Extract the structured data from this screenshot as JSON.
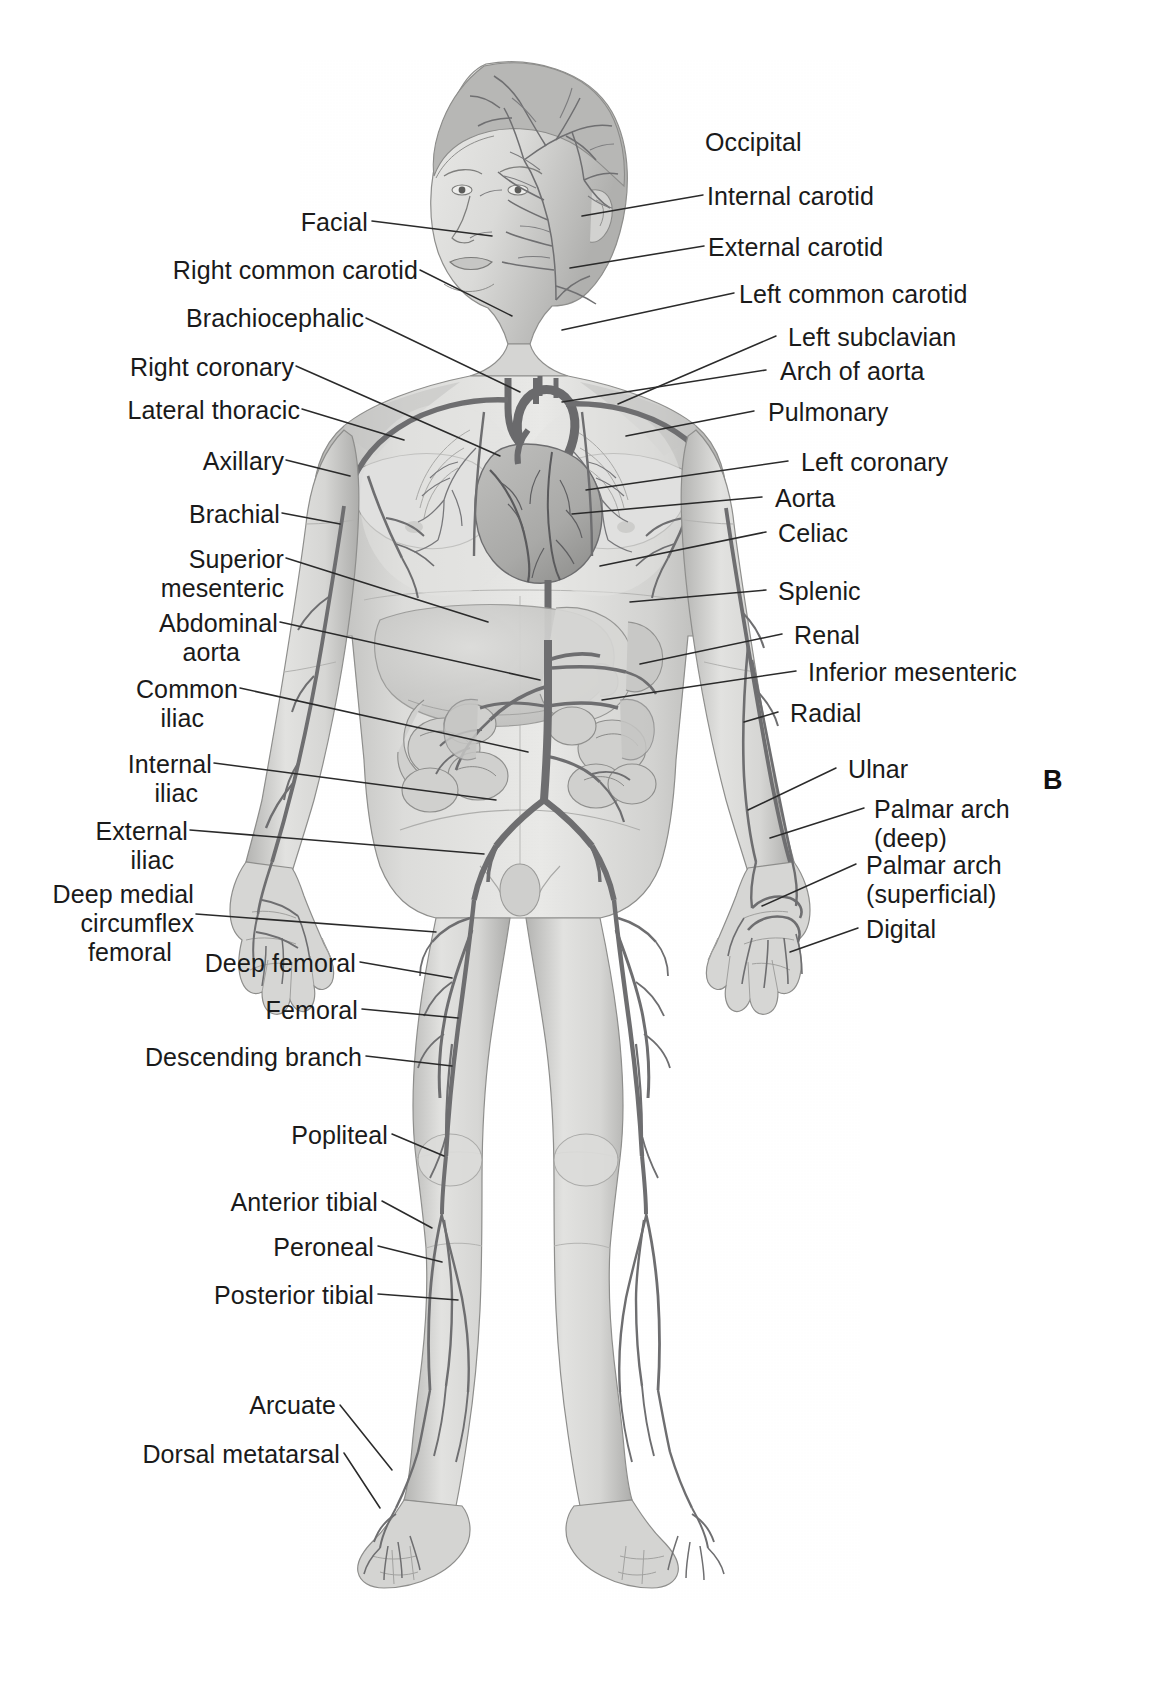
{
  "figure": {
    "panel_letter": "B",
    "title_caption": ""
  },
  "labels_left": [
    {
      "id": "facial",
      "text": "Facial",
      "lines": [
        "Facial"
      ]
    },
    {
      "id": "right-common-carotid",
      "text": "Right common carotid",
      "lines": [
        "Right common carotid"
      ]
    },
    {
      "id": "brachiocephalic",
      "text": "Brachiocephalic",
      "lines": [
        "Brachiocephalic"
      ]
    },
    {
      "id": "right-coronary",
      "text": "Right coronary",
      "lines": [
        "Right coronary"
      ]
    },
    {
      "id": "lateral-thoracic",
      "text": "Lateral thoracic",
      "lines": [
        "Lateral thoracic"
      ]
    },
    {
      "id": "axillary",
      "text": "Axillary",
      "lines": [
        "Axillary"
      ]
    },
    {
      "id": "brachial",
      "text": "Brachial",
      "lines": [
        "Brachial"
      ]
    },
    {
      "id": "superior-mesenteric",
      "text": "Superior mesenteric",
      "lines": [
        "Superior",
        "mesenteric"
      ]
    },
    {
      "id": "abdominal-aorta",
      "text": "Abdominal aorta",
      "lines": [
        "Abdominal",
        "aorta"
      ]
    },
    {
      "id": "common-iliac",
      "text": "Common iliac",
      "lines": [
        "Common",
        "iliac"
      ]
    },
    {
      "id": "internal-iliac",
      "text": "Internal iliac",
      "lines": [
        "Internal",
        "iliac"
      ]
    },
    {
      "id": "external-iliac",
      "text": "External iliac",
      "lines": [
        "External",
        "iliac"
      ]
    },
    {
      "id": "deep-medial-circumflex-femoral",
      "text": "Deep medial circumflex femoral",
      "lines": [
        "Deep medial",
        "circumflex",
        "femoral"
      ]
    },
    {
      "id": "deep-femoral",
      "text": "Deep femoral",
      "lines": [
        "Deep femoral"
      ]
    },
    {
      "id": "femoral",
      "text": "Femoral",
      "lines": [
        "Femoral"
      ]
    },
    {
      "id": "descending-branch",
      "text": "Descending branch",
      "lines": [
        "Descending branch"
      ]
    },
    {
      "id": "popliteal",
      "text": "Popliteal",
      "lines": [
        "Popliteal"
      ]
    },
    {
      "id": "anterior-tibial",
      "text": "Anterior tibial",
      "lines": [
        "Anterior tibial"
      ]
    },
    {
      "id": "peroneal",
      "text": "Peroneal",
      "lines": [
        "Peroneal"
      ]
    },
    {
      "id": "posterior-tibial",
      "text": "Posterior tibial",
      "lines": [
        "Posterior tibial"
      ]
    },
    {
      "id": "arcuate",
      "text": "Arcuate",
      "lines": [
        "Arcuate"
      ]
    },
    {
      "id": "dorsal-metatarsal",
      "text": "Dorsal metatarsal",
      "lines": [
        "Dorsal metatarsal"
      ]
    }
  ],
  "labels_right": [
    {
      "id": "occipital",
      "text": "Occipital",
      "lines": [
        "Occipital"
      ]
    },
    {
      "id": "internal-carotid",
      "text": "Internal carotid",
      "lines": [
        "Internal carotid"
      ]
    },
    {
      "id": "external-carotid",
      "text": "External carotid",
      "lines": [
        "External carotid"
      ]
    },
    {
      "id": "left-common-carotid",
      "text": "Left common carotid",
      "lines": [
        "Left common carotid"
      ]
    },
    {
      "id": "left-subclavian",
      "text": "Left subclavian",
      "lines": [
        "Left subclavian"
      ]
    },
    {
      "id": "arch-of-aorta",
      "text": "Arch of aorta",
      "lines": [
        "Arch of aorta"
      ]
    },
    {
      "id": "pulmonary",
      "text": "Pulmonary",
      "lines": [
        "Pulmonary"
      ]
    },
    {
      "id": "left-coronary",
      "text": "Left coronary",
      "lines": [
        "Left coronary"
      ]
    },
    {
      "id": "aorta",
      "text": "Aorta",
      "lines": [
        "Aorta"
      ]
    },
    {
      "id": "celiac",
      "text": "Celiac",
      "lines": [
        "Celiac"
      ]
    },
    {
      "id": "splenic",
      "text": "Splenic",
      "lines": [
        "Splenic"
      ]
    },
    {
      "id": "renal",
      "text": "Renal",
      "lines": [
        "Renal"
      ]
    },
    {
      "id": "inferior-mesenteric",
      "text": "Inferior mesenteric",
      "lines": [
        "Inferior mesenteric"
      ]
    },
    {
      "id": "radial",
      "text": "Radial",
      "lines": [
        "Radial"
      ]
    },
    {
      "id": "ulnar",
      "text": "Ulnar",
      "lines": [
        "Ulnar"
      ]
    },
    {
      "id": "palmar-arch-deep",
      "text": "Palmar arch (deep)",
      "lines": [
        "Palmar arch",
        "(deep)"
      ]
    },
    {
      "id": "palmar-arch-superficial",
      "text": "Palmar arch (superficial)",
      "lines": [
        "Palmar arch",
        "(superficial)"
      ]
    },
    {
      "id": "digital",
      "text": "Digital",
      "lines": [
        "Digital"
      ]
    }
  ],
  "colors": {
    "background": "#ffffff",
    "text": "#1a1a1a",
    "leader_line": "#2a2a2a",
    "body_fill": "#d8d8d6",
    "body_shade": "#b9b9b7",
    "body_light": "#e8e8e6",
    "artery": "#6e6e70",
    "artery_dark": "#4a4a4c",
    "organ": "#c9c9c7"
  }
}
